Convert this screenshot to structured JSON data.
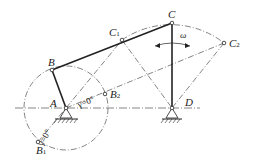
{
  "diagram": {
    "type": "four-bar crank-rocker mechanism",
    "points": {
      "A": {
        "label": "A"
      },
      "B": {
        "label": "B"
      },
      "C": {
        "label": "C"
      },
      "D": {
        "label": "D"
      },
      "B1": {
        "label": "B",
        "sub": "1"
      },
      "B2": {
        "label": "B",
        "sub": "2"
      },
      "C1": {
        "label": "C",
        "sub": "1"
      },
      "C2": {
        "label": "C",
        "sub": "2"
      }
    },
    "angular_velocity": "ω",
    "annotations": {
      "gamma_upper": "γ=0°",
      "gamma_lower": "γ=0°"
    },
    "colors": {
      "line": "#222222",
      "background": "#ffffff"
    }
  }
}
